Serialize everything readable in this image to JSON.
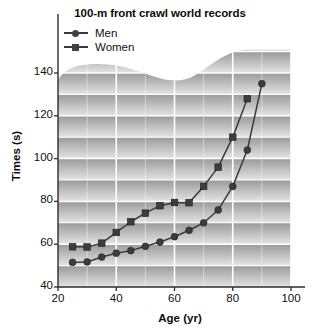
{
  "chart_data": {
    "type": "line",
    "title": "100-m front crawl world records",
    "xlabel": "Age (yr)",
    "ylabel": "Times (s)",
    "xlim": [
      20,
      100
    ],
    "ylim": [
      40,
      145
    ],
    "xticks": [
      20,
      40,
      60,
      80,
      100
    ],
    "yticks": [
      40,
      60,
      80,
      100,
      120,
      140
    ],
    "grid": true,
    "legend_position": "top-left-inside",
    "background": "banded-gradient-gray",
    "series": [
      {
        "name": "Men",
        "marker": "circle",
        "color": "#3d3d3d",
        "x": [
          25,
          30,
          35,
          40,
          45,
          50,
          55,
          60,
          65,
          70,
          75,
          80,
          85,
          90
        ],
        "y": [
          51.5,
          51.7,
          54.0,
          55.8,
          57.0,
          59.0,
          61.0,
          63.5,
          66.5,
          70.0,
          76.0,
          87.0,
          104.0,
          135.0
        ]
      },
      {
        "name": "Women",
        "marker": "square",
        "color": "#3d3d3d",
        "x": [
          25,
          30,
          35,
          40,
          45,
          50,
          55,
          60,
          65,
          70,
          75,
          80,
          85
        ],
        "y": [
          58.8,
          58.7,
          60.5,
          65.5,
          70.5,
          74.5,
          78.0,
          79.5,
          79.4,
          87.0,
          96.0,
          110.0,
          128.0
        ]
      }
    ]
  },
  "legend": {
    "items": [
      {
        "label": "Men",
        "marker": "circle"
      },
      {
        "label": "Women",
        "marker": "square"
      }
    ]
  },
  "colors": {
    "marker": "#3d3d3d",
    "line": "#3a3a3a",
    "gridline": "#ffffff",
    "axis": "#2b2b2b",
    "band_dark": "#9a9a9a",
    "band_light": "#e4e4e4",
    "text": "#111111"
  }
}
